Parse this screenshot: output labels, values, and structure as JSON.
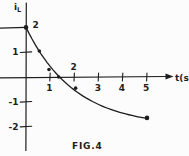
{
  "figure": {
    "caption": "FIG.4",
    "background_color": "#fcfcfc",
    "ink_color": "#1e1e1e"
  },
  "chart_data": {
    "type": "line",
    "title": "FIG.4",
    "xlabel": "t(s)",
    "ylabel": "iL",
    "ylabel_main": "i",
    "ylabel_sub": "L",
    "xlim": [
      0,
      5.8
    ],
    "ylim": [
      -2.9,
      2.9
    ],
    "grid": "off",
    "x_ticks": [
      {
        "value": 1,
        "label": "1",
        "side": "below"
      },
      {
        "value": 2,
        "label": "2",
        "side": "above"
      },
      {
        "value": 3,
        "label": "3",
        "side": "below"
      },
      {
        "value": 4,
        "label": "4",
        "side": "below"
      },
      {
        "value": 5,
        "label": "5",
        "side": "below"
      }
    ],
    "y_ticks": [
      {
        "value": 2,
        "label": "2",
        "side": "right",
        "tick_mark": false
      },
      {
        "value": 1,
        "label": "1",
        "side": "left",
        "tick_mark": true
      },
      {
        "value": -1,
        "label": "-1",
        "side": "left",
        "tick_mark": true
      },
      {
        "value": -2,
        "label": "-2",
        "side": "left",
        "tick_mark": true
      }
    ],
    "guide_level": 2,
    "model": {
      "description": "iL(t) = -2 + 4*exp(-t/2)",
      "initial_value": 2,
      "final_asymptote": -2,
      "time_constant_s": 2,
      "t_range": [
        0,
        5
      ]
    },
    "points": [
      {
        "t": 0,
        "i": 2
      },
      {
        "t": 0.55,
        "i": 1.05
      },
      {
        "t": 0.95,
        "i": 0.3
      },
      {
        "t": 1.35,
        "i": 0
      },
      {
        "t": 2.05,
        "i": -0.45
      },
      {
        "t": 5,
        "i": -1.65
      }
    ]
  }
}
